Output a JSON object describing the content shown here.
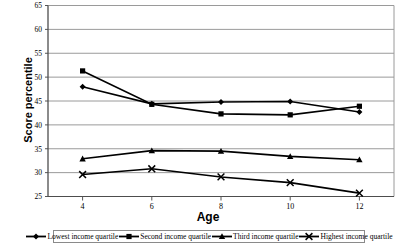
{
  "chart_data": {
    "type": "line",
    "title": "",
    "xlabel": "Age",
    "ylabel": "Score percentile",
    "x": [
      4,
      6,
      8,
      10,
      12
    ],
    "xticklabels": [
      "4",
      "6",
      "8",
      "10",
      "12"
    ],
    "xlim": [
      3,
      13
    ],
    "ylim": [
      25,
      65
    ],
    "yticks": [
      25,
      30,
      35,
      40,
      45,
      50,
      55,
      60,
      65
    ],
    "yticklabels": [
      "25",
      "30",
      "35",
      "40",
      "45",
      "50",
      "55",
      "60",
      "65"
    ],
    "grid": "horizontal",
    "legend_position": "bottom",
    "series": [
      {
        "name": "Lowest income quartile",
        "marker": "diamond",
        "color": "#000000",
        "values": [
          48.0,
          44.4,
          44.8,
          44.9,
          42.7
        ]
      },
      {
        "name": "Second income quartile",
        "marker": "square",
        "color": "#000000",
        "values": [
          51.3,
          44.3,
          42.3,
          42.1,
          43.9
        ]
      },
      {
        "name": "Third income quartile",
        "marker": "triangle",
        "color": "#000000",
        "values": [
          32.9,
          34.6,
          34.5,
          33.4,
          32.7
        ]
      },
      {
        "name": "Highest income quartile",
        "marker": "x",
        "color": "#000000",
        "values": [
          29.6,
          30.8,
          29.1,
          27.9,
          25.7
        ]
      }
    ]
  },
  "axes": {
    "y_title": "Score percentile",
    "x_title": "Age"
  },
  "legend": {
    "items": [
      {
        "label": "Lowest income quartile",
        "marker": "diamond"
      },
      {
        "label": "Second income quartile",
        "marker": "square"
      },
      {
        "label": "Third income quartile",
        "marker": "triangle"
      },
      {
        "label": "Highest income quartile",
        "marker": "x"
      }
    ]
  }
}
